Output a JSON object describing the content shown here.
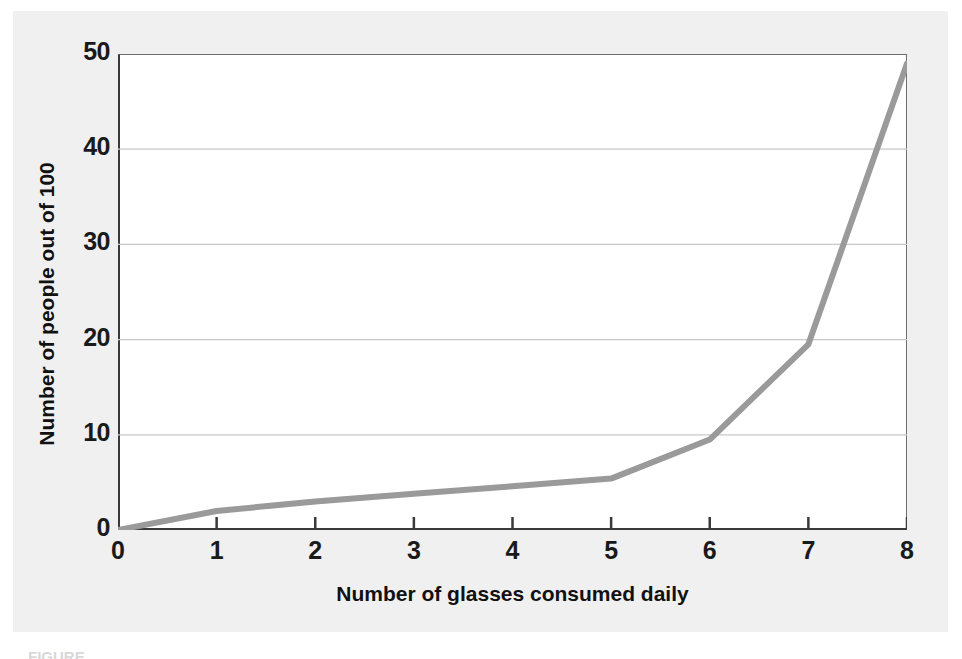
{
  "chart_data": {
    "type": "line",
    "title": "",
    "xlabel": "Number of glasses consumed daily",
    "ylabel": "Number of people out of 100",
    "x": [
      0,
      1,
      2,
      3,
      4,
      5,
      6,
      7,
      8
    ],
    "values": [
      0,
      2,
      3,
      3.8,
      4.6,
      5.4,
      9.5,
      19.5,
      49
    ],
    "series": [
      {
        "name": "people",
        "values": [
          0,
          2,
          3,
          3.8,
          4.6,
          5.4,
          9.5,
          19.5,
          49
        ]
      }
    ],
    "xlim": [
      0,
      8
    ],
    "ylim": [
      0,
      50
    ],
    "x_ticks": [
      "0",
      "1",
      "2",
      "3",
      "4",
      "5",
      "6",
      "7",
      "8"
    ],
    "y_ticks": [
      "0",
      "10",
      "20",
      "30",
      "40",
      "50"
    ],
    "grid": "horizontal",
    "legend": "none",
    "line_color": "#9a9a9a",
    "grid_color": "#c8c8c8",
    "axis_color": "#3a3a3a",
    "panel_color": "#f0f0f0",
    "plot_bg": "#ffffff"
  },
  "figure": {
    "caption": "FIGURE"
  }
}
